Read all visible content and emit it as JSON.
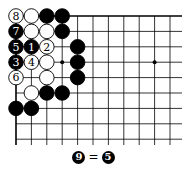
{
  "board": {
    "origin": {
      "x": 16,
      "y": 16
    },
    "spacing": 15.4,
    "cols_visible": 11,
    "rows_visible": 9,
    "right_edge_x": 182,
    "edges": [
      "top",
      "left"
    ],
    "star_points": [
      [
        3,
        3
      ],
      [
        9,
        3
      ]
    ],
    "stones": [
      {
        "c": 0,
        "r": 0,
        "color": "white",
        "label": "8"
      },
      {
        "c": 1,
        "r": 0,
        "color": "white",
        "label": ""
      },
      {
        "c": 2,
        "r": 0,
        "color": "black",
        "label": ""
      },
      {
        "c": 3,
        "r": 0,
        "color": "black",
        "label": ""
      },
      {
        "c": 0,
        "r": 1,
        "color": "black",
        "label": "7"
      },
      {
        "c": 1,
        "r": 1,
        "color": "white",
        "label": ""
      },
      {
        "c": 2,
        "r": 1,
        "color": "white",
        "label": ""
      },
      {
        "c": 3,
        "r": 1,
        "color": "black",
        "label": ""
      },
      {
        "c": 0,
        "r": 2,
        "color": "black",
        "label": "5"
      },
      {
        "c": 1,
        "r": 2,
        "color": "black",
        "label": "1"
      },
      {
        "c": 2,
        "r": 2,
        "color": "white",
        "label": "2"
      },
      {
        "c": 4,
        "r": 2,
        "color": "black",
        "label": ""
      },
      {
        "c": 0,
        "r": 3,
        "color": "black",
        "label": "3"
      },
      {
        "c": 1,
        "r": 3,
        "color": "white",
        "label": "4"
      },
      {
        "c": 2,
        "r": 3,
        "color": "white",
        "label": ""
      },
      {
        "c": 4,
        "r": 3,
        "color": "black",
        "label": ""
      },
      {
        "c": 0,
        "r": 4,
        "color": "white",
        "label": "6"
      },
      {
        "c": 2,
        "r": 4,
        "color": "white",
        "label": ""
      },
      {
        "c": 4,
        "r": 4,
        "color": "black",
        "label": ""
      },
      {
        "c": 1,
        "r": 5,
        "color": "white",
        "label": ""
      },
      {
        "c": 2,
        "r": 5,
        "color": "black",
        "label": ""
      },
      {
        "c": 3,
        "r": 5,
        "color": "black",
        "label": ""
      },
      {
        "c": 0,
        "r": 6,
        "color": "black",
        "label": ""
      },
      {
        "c": 1,
        "r": 6,
        "color": "black",
        "label": ""
      }
    ]
  },
  "caption": {
    "left_stone": "9",
    "equals": "=",
    "right_stone": "5"
  }
}
